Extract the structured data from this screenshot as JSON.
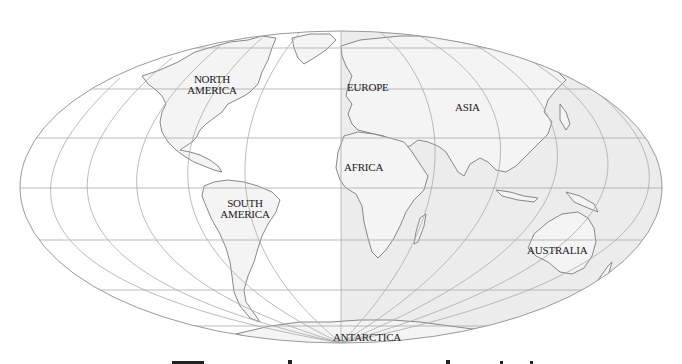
{
  "map": {
    "projection": "pseudocylindrical equal-area (oblique)",
    "colors": {
      "background": "#ffffff",
      "western_hemisphere_fill": "#ffffff",
      "eastern_hemisphere_fill": "#ececec",
      "land_fill": "#f2f2f2",
      "graticule": "#a9a9a9",
      "coastline": "#7a7a7a",
      "label": "#1a1a1a"
    },
    "labels": {
      "north_america": [
        "NORTH",
        "AMERICA"
      ],
      "europe": "EUROPE",
      "asia": "ASIA",
      "africa": "AFRICA",
      "south_america": [
        "SOUTH",
        "AMERICA"
      ],
      "australia": "AUSTRALIA",
      "antarctica": "ANTARCTICA"
    }
  }
}
